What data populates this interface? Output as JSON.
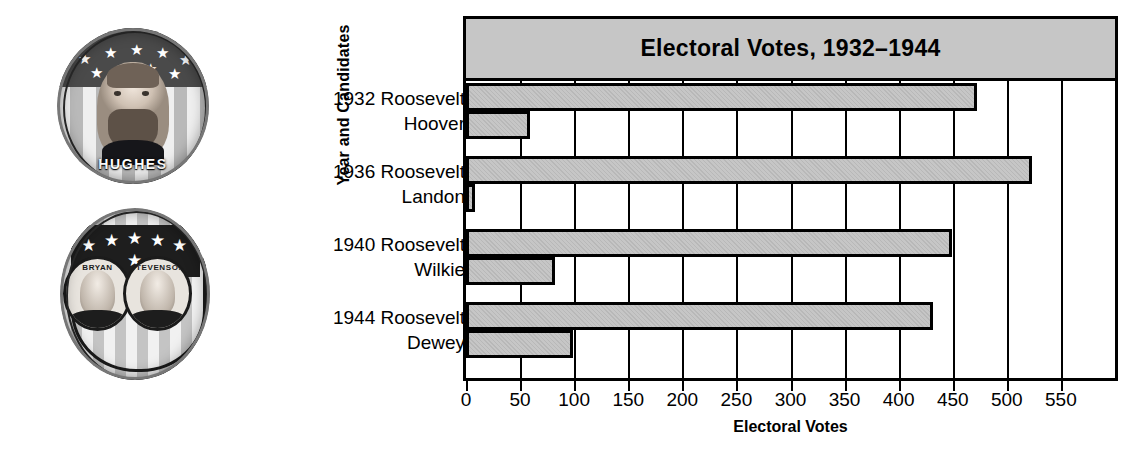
{
  "photos": [
    {
      "name": "hughes-campaign-button",
      "caption": "HUGHES",
      "stars": [
        "★",
        "★",
        "★",
        "★",
        "★",
        "★",
        "★",
        "★",
        "★"
      ]
    },
    {
      "name": "bryan-stevenson-campaign-button",
      "left_caption": "BRYAN",
      "right_caption": "STEVENSON",
      "stars": [
        "★",
        "★",
        "★",
        "★",
        "★",
        "★"
      ]
    }
  ],
  "chart_data": {
    "type": "bar",
    "orientation": "horizontal",
    "title": "Electoral Votes, 1932–1944",
    "xlabel": "Electoral Votes",
    "ylabel": "Year and Candidates",
    "xlim": [
      0,
      600
    ],
    "xticks": [
      0,
      50,
      100,
      150,
      200,
      250,
      300,
      350,
      400,
      450,
      500,
      550
    ],
    "xtick_labels": [
      "0",
      "50",
      "100",
      "150",
      "200",
      "250",
      "300",
      "350",
      "400",
      "450",
      "500",
      "550"
    ],
    "grid": true,
    "legend": "none",
    "groups": [
      {
        "year": "1932",
        "line_top": "1932 Roosevelt",
        "line_bottom": "Hoover",
        "bars": [
          {
            "label": "Roosevelt",
            "value": 472
          },
          {
            "label": "Hoover",
            "value": 59
          }
        ]
      },
      {
        "year": "1936",
        "line_top": "1936 Roosevelt",
        "line_bottom": "Landon",
        "bars": [
          {
            "label": "Roosevelt",
            "value": 523
          },
          {
            "label": "Landon",
            "value": 8
          }
        ]
      },
      {
        "year": "1940",
        "line_top": "1940 Roosevelt",
        "line_bottom": "Wilkie",
        "bars": [
          {
            "label": "Roosevelt",
            "value": 449
          },
          {
            "label": "Wilkie",
            "value": 82
          }
        ]
      },
      {
        "year": "1944",
        "line_top": "1944 Roosevelt",
        "line_bottom": "Dewey",
        "bars": [
          {
            "label": "Roosevelt",
            "value": 432
          },
          {
            "label": "Dewey",
            "value": 99
          }
        ]
      }
    ],
    "colors": {
      "bar_fill": "#c6c6c6",
      "bar_stroke": "#000000",
      "title_band": "#c6c6c6",
      "background": "#ffffff"
    }
  }
}
